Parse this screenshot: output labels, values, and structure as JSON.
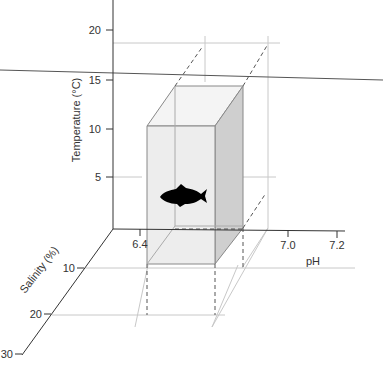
{
  "figure": {
    "type": "3d-tolerance-box",
    "axes": {
      "temperature": {
        "label": "Temperature (°C)",
        "ticks": [
          "5",
          "10",
          "15",
          "20"
        ]
      },
      "ph": {
        "label": "pH",
        "ticks": [
          "6.4",
          "7.0",
          "7.2"
        ]
      },
      "salinity": {
        "label": "Salinity (%)",
        "ticks": [
          "10",
          "20",
          "30"
        ]
      }
    },
    "box": {
      "temperature_range": [
        "5",
        "15"
      ],
      "ph_range": [
        "6.4",
        "7.0"
      ],
      "salinity_range": [
        "10",
        "20"
      ]
    },
    "icon": "fish-icon"
  },
  "colors": {
    "axis": "#333333",
    "grid": "#c8c8c8",
    "box_front": "#ededed",
    "box_side": "#cfcfcf",
    "box_top": "#f4f4f4",
    "fish": "#000000"
  }
}
